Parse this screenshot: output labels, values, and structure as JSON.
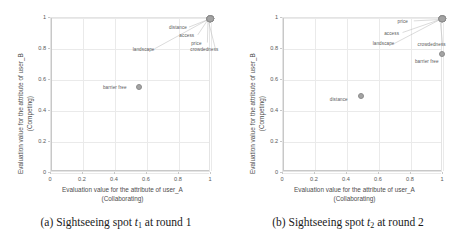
{
  "figure": {
    "background": "#ffffff",
    "marker_color": "#a3a3a3",
    "grid_color": "#eaeaea",
    "panels": [
      {
        "id": "a",
        "caption_prefix": "(a)",
        "caption_word": "Sightseeing spot",
        "caption_var": "t",
        "caption_sub": "1",
        "caption_tail": "at round 1",
        "caption_full": "(a) Sightseeing spot t1 at round 1",
        "xlabel_line1": "Evaluation value for the attribute of user_A",
        "xlabel_line2": "(Collaborating)",
        "ylabel_line1": "Evaluation value for the attribute of user_B",
        "ylabel_line2": "(Competing)",
        "xticks": [
          "0",
          "0.2",
          "0.4",
          "0.6",
          "0.8",
          "1"
        ],
        "yticks": [
          "0",
          "0.2",
          "0.4",
          "0.6",
          "0.8",
          "1"
        ]
      },
      {
        "id": "b",
        "caption_prefix": "(b)",
        "caption_word": "Sightseeing spot",
        "caption_var": "t",
        "caption_sub": "2",
        "caption_tail": "at round 2",
        "caption_full": "(b) Sightseeing spot t2 at round 2",
        "xlabel_line1": "Evaluation value for the attribute of user_A",
        "xlabel_line2": "(Collaborating)",
        "ylabel_line1": "Evaluation value for the attribute of user_B",
        "ylabel_line2": "(Competing)",
        "xticks": [
          "0",
          "0.2",
          "0.4",
          "0.6",
          "0.8",
          "1"
        ],
        "yticks": [
          "0",
          "0.2",
          "0.4",
          "0.6",
          "0.8",
          "1"
        ]
      }
    ]
  },
  "chart_data": [
    {
      "type": "scatter",
      "title": "(a) Sightseeing spot t1 at round 1",
      "xlabel": "Evaluation value for the attribute of user_A (Collaborating)",
      "ylabel": "Evaluation value for the attribute of user_B (Competing)",
      "xlim": [
        0,
        1
      ],
      "ylim": [
        0,
        1
      ],
      "xticks": [
        0,
        0.2,
        0.4,
        0.6,
        0.8,
        1
      ],
      "yticks": [
        0,
        0.2,
        0.4,
        0.6,
        0.8,
        1
      ],
      "grid": true,
      "legend": "none",
      "points": [
        {
          "label": "distance",
          "x": 1.0,
          "y": 0.99,
          "label_x": 0.8,
          "label_y": 0.935,
          "leader": true
        },
        {
          "label": "access",
          "x": 1.0,
          "y": 0.99,
          "label_x": 0.855,
          "label_y": 0.885,
          "leader": true
        },
        {
          "label": "price",
          "x": 1.0,
          "y": 0.99,
          "label_x": 0.915,
          "label_y": 0.835,
          "leader": true
        },
        {
          "label": "crowdedness",
          "x": 1.0,
          "y": 0.99,
          "label_x": 0.965,
          "label_y": 0.795,
          "leader": true
        },
        {
          "label": "landscape",
          "x": 1.0,
          "y": 0.99,
          "label_x": 0.585,
          "label_y": 0.795,
          "leader": true
        },
        {
          "label": "barrier free",
          "x": 0.555,
          "y": 0.55,
          "label_x": 0.405,
          "label_y": 0.548,
          "leader": false
        }
      ]
    },
    {
      "type": "scatter",
      "title": "(b) Sightseeing spot t2 at round 2",
      "xlabel": "Evaluation value for the attribute of user_A (Collaborating)",
      "ylabel": "Evaluation value for the attribute of user_B (Competing)",
      "xlim": [
        0,
        1
      ],
      "ylim": [
        0,
        1
      ],
      "xticks": [
        0,
        0.2,
        0.4,
        0.6,
        0.8,
        1
      ],
      "yticks": [
        0,
        0.2,
        0.4,
        0.6,
        0.8,
        1
      ],
      "grid": true,
      "legend": "none",
      "points": [
        {
          "label": "price",
          "x": 1.0,
          "y": 0.99,
          "label_x": 0.755,
          "label_y": 0.975,
          "leader": true
        },
        {
          "label": "access",
          "x": 1.0,
          "y": 0.99,
          "label_x": 0.685,
          "label_y": 0.9,
          "leader": true
        },
        {
          "label": "landscape",
          "x": 1.0,
          "y": 0.99,
          "label_x": 0.635,
          "label_y": 0.83,
          "leader": true
        },
        {
          "label": "crowdedness",
          "x": 1.0,
          "y": 0.99,
          "label_x": 0.935,
          "label_y": 0.828,
          "leader": true
        },
        {
          "label": "barrier free",
          "x": 1.0,
          "y": 0.762,
          "label_x": 0.905,
          "label_y": 0.718,
          "leader": false
        },
        {
          "label": "distance",
          "x": 0.492,
          "y": 0.492,
          "label_x": 0.355,
          "label_y": 0.47,
          "leader": false
        }
      ]
    }
  ]
}
